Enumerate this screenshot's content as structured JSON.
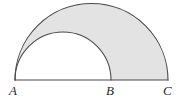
{
  "figure": {
    "background_color": "#ffffff",
    "stroke_color": "#4a4a4a",
    "shaded_fill_color": "#e3e3e3",
    "unshaded_fill_color": "#ffffff",
    "baseline": {
      "y": 80,
      "x_start": 15,
      "x_end": 168,
      "label": "baseline AC"
    },
    "points": [
      {
        "id": "A",
        "label": "A",
        "x": 15,
        "y": 80
      },
      {
        "id": "B",
        "label": "B",
        "x": 111,
        "y": 80
      },
      {
        "id": "C",
        "label": "C",
        "x": 168,
        "y": 80
      }
    ],
    "semicircles": [
      {
        "id": "large",
        "diameter_endpoints": [
          "A",
          "C"
        ],
        "center_x": 91.5,
        "center_y": 80,
        "radius": 76.5,
        "apex_y": 3.5,
        "filled": true,
        "fill": "#e3e3e3"
      },
      {
        "id": "small",
        "diameter_endpoints": [
          "A",
          "B"
        ],
        "center_x": 63,
        "center_y": 80,
        "radius": 48,
        "apex_y": 32,
        "filled": false,
        "fill": "#ffffff"
      }
    ],
    "shaded_region_description": "Large semicircle on AC minus small semicircle on AB"
  },
  "chart_data": {
    "type": "diagram",
    "xlabel": "",
    "ylabel": "",
    "categories": [
      "A",
      "B",
      "C"
    ],
    "values": [
      15,
      111,
      168
    ],
    "annotations": [
      "A",
      "B",
      "C"
    ],
    "grid": false,
    "legend": "none"
  }
}
